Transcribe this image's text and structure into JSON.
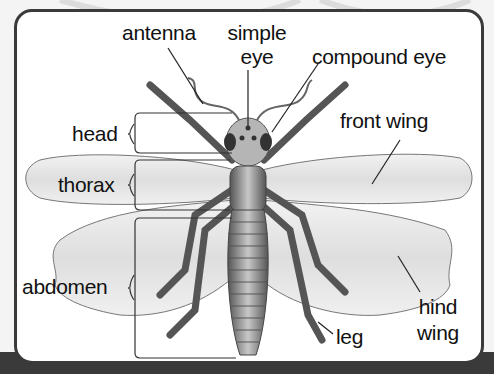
{
  "diagram": {
    "labels": {
      "antenna": "antenna",
      "simple_eye_line1": "simple",
      "simple_eye_line2": "eye",
      "compound_eye": "compound eye",
      "head": "head",
      "thorax": "thorax",
      "abdomen": "abdomen",
      "front_wing": "front wing",
      "hind_wing_line1": "hind",
      "hind_wing_line2": "wing",
      "leg": "leg"
    },
    "colors": {
      "frame": "#3a3a3a",
      "background": "#ffffff",
      "body": "#8a8a8a",
      "wing": "#e6e6e6",
      "text": "#111111"
    }
  }
}
